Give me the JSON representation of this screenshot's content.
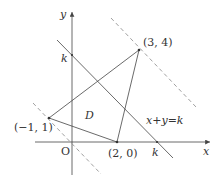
{
  "figure": {
    "axes": {
      "x_label": "x",
      "y_label": "y",
      "origin_label": "O"
    },
    "points": [
      {
        "id": "A",
        "label": "(−1, 1)",
        "x": -1,
        "y": 1
      },
      {
        "id": "B",
        "label": "(2, 0)",
        "x": 2,
        "y": 0
      },
      {
        "id": "C",
        "label": "(3, 4)",
        "x": 3,
        "y": 4
      }
    ],
    "region_label": "D",
    "line_label": "x+y=k",
    "k_label_y_axis": "k",
    "k_label_x_axis": "k",
    "colors": {
      "stroke": "#444444",
      "dashed": "#888888",
      "text": "#333333"
    }
  }
}
